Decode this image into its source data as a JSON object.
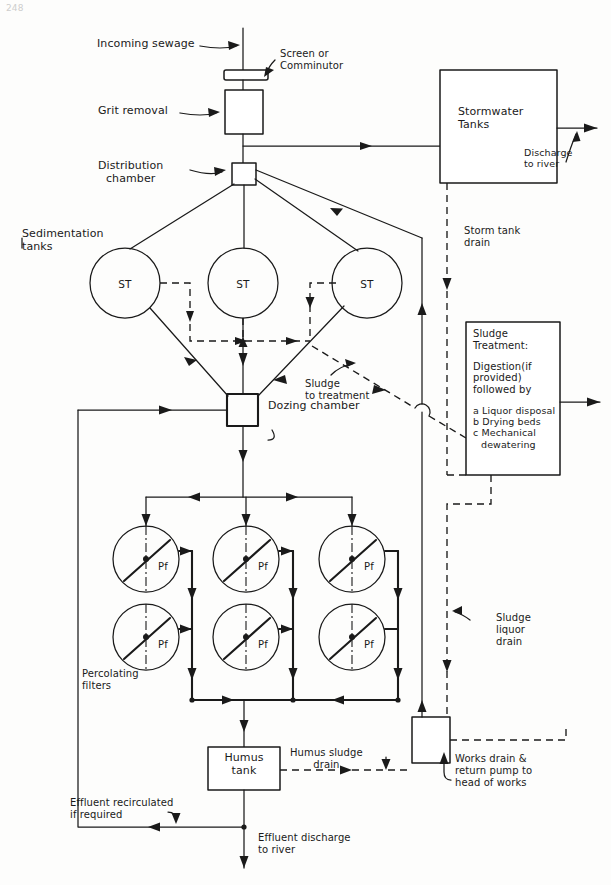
{
  "page": {
    "number": "248"
  },
  "labels": {
    "incoming_sewage": "Incoming sewage",
    "screen_or_comminutor": "Screen or\nComminutor",
    "grit_removal": "Grit removal",
    "distribution_chamber": "Distribution\nchamber",
    "stormwater_tanks": "Stormwater\nTanks",
    "discharge_to_river": "Discharge\nto river",
    "sedimentation_tanks": "Sedimentation\ntanks",
    "storm_tank_drain": "Storm tank\ndrain",
    "sludge_to_treatment": "Sludge\nto treatment",
    "dozing_chamber": "Dozing chamber",
    "percolating_filters": "Percolating\nfilters",
    "sludge_liquor_drain": "Sludge\nliquor\ndrain",
    "humus_tank": "Humus\ntank",
    "humus_sludge_drain": "Humus sludge\ndrain",
    "works_drain_return": "Works drain &\nreturn pump to\nhead of works",
    "effluent_recirculated": "Effluent recirculated\nif required",
    "effluent_discharge": "Effluent discharge\nto river"
  },
  "sludge_treatment_box": {
    "heading_line1": "Sludge",
    "heading_line2": "Treatment:",
    "body_line1": "Digestion(if",
    "body_line2": "provided)",
    "body_line3": "followed by",
    "item_a": "a Liquor disposal",
    "item_b": "b Drying beds",
    "item_c1": "c Mechanical",
    "item_c2": "dewatering"
  },
  "node_labels": {
    "sedimentation_tank": "ST",
    "percolating_filter": "Pf"
  },
  "sedimentation_tanks": [
    {
      "id": "st-left",
      "label": "ST",
      "cx": 125,
      "cy": 283,
      "r": 35
    },
    {
      "id": "st-middle",
      "label": "ST",
      "cx": 243,
      "cy": 283,
      "r": 35
    },
    {
      "id": "st-right",
      "label": "ST",
      "cx": 367,
      "cy": 283,
      "r": 35
    }
  ],
  "percolating_filters": [
    {
      "id": "pf-r1c1",
      "label": "Pf",
      "cx": 146,
      "cy": 559,
      "r": 33
    },
    {
      "id": "pf-r1c2",
      "label": "Pf",
      "cx": 246,
      "cy": 559,
      "r": 33
    },
    {
      "id": "pf-r1c3",
      "label": "Pf",
      "cx": 352,
      "cy": 559,
      "r": 33
    },
    {
      "id": "pf-r2c1",
      "label": "Pf",
      "cx": 146,
      "cy": 637,
      "r": 33
    },
    {
      "id": "pf-r2c2",
      "label": "Pf",
      "cx": 246,
      "cy": 637,
      "r": 33
    },
    {
      "id": "pf-r2c3",
      "label": "Pf",
      "cx": 352,
      "cy": 637,
      "r": 33
    }
  ],
  "boxes": {
    "grit_removal": {
      "x": 225,
      "y": 90,
      "w": 38,
      "h": 44
    },
    "distribution_chamber": {
      "x": 232,
      "y": 163,
      "w": 24,
      "h": 22
    },
    "stormwater_tanks": {
      "x": 440,
      "y": 70,
      "w": 117,
      "h": 113
    },
    "sludge_treatment": {
      "x": 466,
      "y": 322,
      "w": 94,
      "h": 153
    },
    "dozing_chamber": {
      "x": 227,
      "y": 394,
      "w": 31,
      "h": 32
    },
    "humus_tank": {
      "x": 208,
      "y": 747,
      "w": 72,
      "h": 43
    },
    "works_drain": {
      "x": 412,
      "y": 717,
      "w": 38,
      "h": 46
    }
  },
  "colors": {
    "ink": "#1a1a1a",
    "paper": "#fdfdfc"
  },
  "legend": {
    "solid_line_meaning": "liquid flow",
    "dashed_line_meaning": "sludge / drain flow",
    "dash_dot_meaning": "filter distributor arm axis"
  }
}
